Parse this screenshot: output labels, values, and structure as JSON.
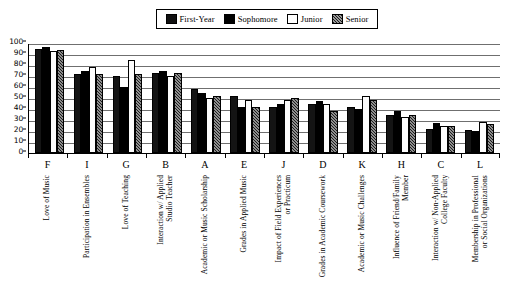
{
  "legend": {
    "entries": [
      {
        "label": "First-Year",
        "swatch": "solid-black",
        "color": "#141414"
      },
      {
        "label": "Sophomore",
        "swatch": "solid-black",
        "color": "#000000"
      },
      {
        "label": "Junior",
        "swatch": "outline-white",
        "color": "#ffffff"
      },
      {
        "label": "Senior",
        "swatch": "hatched-dark",
        "color": "#1c1c1c"
      }
    ]
  },
  "chart_data": {
    "type": "bar",
    "title": "",
    "subtitle": "",
    "xlabel": "",
    "ylabel": "",
    "ylim": [
      0,
      100
    ],
    "yticks": [
      0,
      10,
      20,
      30,
      40,
      50,
      60,
      70,
      80,
      90,
      100
    ],
    "grid": true,
    "legend_position": "top-center",
    "codes": [
      "F",
      "I",
      "G",
      "B",
      "A",
      "E",
      "J",
      "D",
      "K",
      "H",
      "C",
      "L"
    ],
    "categories": [
      "Love of Music",
      "Participation in Ensembles",
      "Love of Teaching",
      "Interaction w/ Applied\nStudio Teacher",
      "Academic or Music Scholarship",
      "Grades in Applied Music",
      "Impact of Field Experiences\nor Practicum",
      "Grades in Academic Coursework",
      "Academic or Music Challenges",
      "Influence of Friend/Family Member",
      "Interaction w/ Non-Applied\nCollege Faculty",
      "Membership in Professional\nor Social Organizations"
    ],
    "series": [
      {
        "name": "First-Year",
        "values": [
          95,
          72,
          70,
          73,
          58,
          52,
          42,
          45,
          42,
          35,
          22,
          21
        ]
      },
      {
        "name": "Sophomore",
        "values": [
          96,
          75,
          60,
          75,
          55,
          42,
          45,
          47,
          40,
          38,
          27,
          20
        ]
      },
      {
        "name": "Junior",
        "values": [
          93,
          78,
          85,
          70,
          50,
          48,
          48,
          45,
          52,
          33,
          25,
          28
        ]
      },
      {
        "name": "Senior",
        "values": [
          94,
          72,
          72,
          73,
          52,
          42,
          50,
          38,
          48,
          35,
          25,
          26
        ]
      }
    ]
  }
}
